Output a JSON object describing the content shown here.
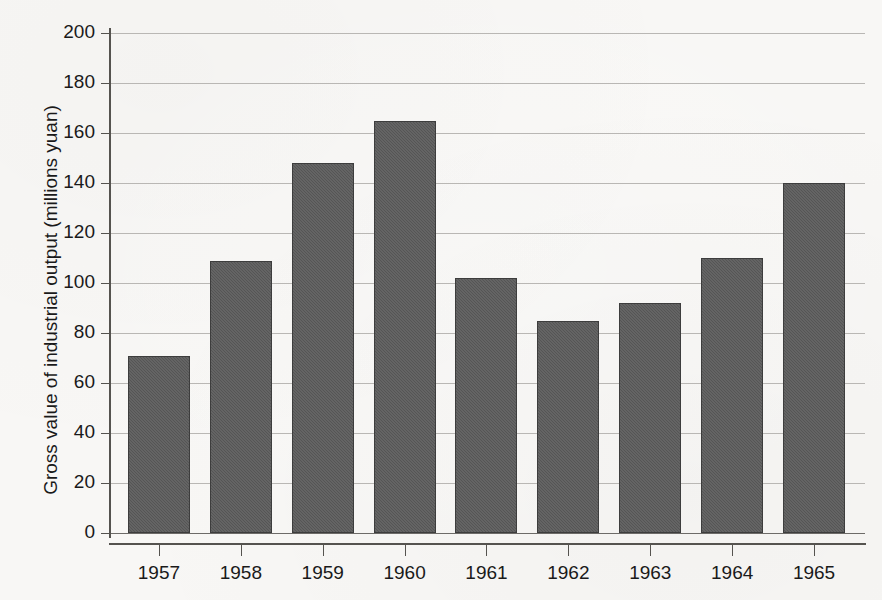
{
  "chart_data": {
    "type": "bar",
    "title": "",
    "xlabel": "",
    "ylabel": "Gross value of industrial output (millions yuan)",
    "categories": [
      "1957",
      "1958",
      "1959",
      "1960",
      "1961",
      "1962",
      "1963",
      "1964",
      "1965"
    ],
    "values": [
      71,
      109,
      148,
      165,
      102,
      85,
      92,
      110,
      140
    ],
    "ylim": [
      0,
      200
    ],
    "ytick_labels": [
      "0",
      "20",
      "40",
      "60",
      "80",
      "100",
      "120",
      "140",
      "160",
      "180",
      "200"
    ],
    "ytick_values": [
      0,
      20,
      40,
      60,
      80,
      100,
      120,
      140,
      160,
      180,
      200
    ],
    "grid": "horizontal",
    "legend": "none",
    "bar_color": "#5a5a5a",
    "bar_edge_color": "#3d3d3d",
    "gridline_color": "#b9b7b4",
    "axis_color": "#55534f",
    "background_color": "#f8f7f5"
  }
}
